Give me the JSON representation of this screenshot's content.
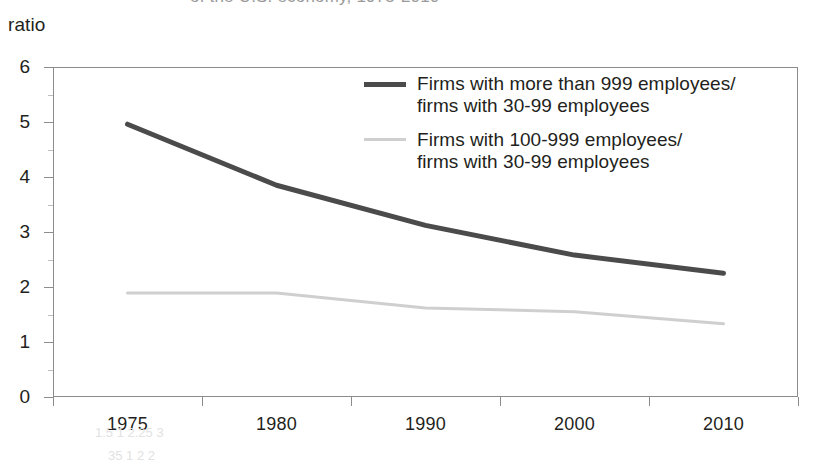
{
  "figure": {
    "unit_label": "ratio",
    "top_cropped_text": "of the U.S. economy, 1975-2010",
    "artifact_text_1": "1.5    1    2.25   3",
    "artifact_text_2": "35   1    2    2"
  },
  "legend": {
    "position": "inside-top-right",
    "entries": [
      {
        "swatch": "dark",
        "color": "#4b4b4b",
        "label": "Firms with more than 999 employees/\nfirms with 30-99 employees"
      },
      {
        "swatch": "light",
        "color": "#cfcfcf",
        "label": "Firms with 100-999 employees/\nfirms with 30-99 employees"
      }
    ]
  },
  "chart_data": {
    "type": "line",
    "title": "",
    "subtitle": "",
    "xlabel": "",
    "ylabel": "ratio",
    "categories": [
      "1975",
      "1980",
      "1990",
      "2000",
      "2010"
    ],
    "xtick_labels": [
      "1975",
      "1980",
      "1990",
      "2000",
      "2010"
    ],
    "ytick_labels": [
      "0",
      "1",
      "2",
      "3",
      "4",
      "5",
      "6"
    ],
    "ytick_values": [
      0,
      1,
      2,
      3,
      4,
      5,
      6
    ],
    "ylim": [
      0,
      6
    ],
    "grid": false,
    "series": [
      {
        "name": "Firms with more than 999 employees/firms with 30-99 employees",
        "color": "#4b4b4b",
        "width": 5,
        "values": [
          4.96,
          3.85,
          3.12,
          2.58,
          2.25
        ]
      },
      {
        "name": "Firms with 100-999 employees/firms with 30-99 employees",
        "color": "#cfcfcf",
        "width": 3,
        "values": [
          1.89,
          1.89,
          1.62,
          1.55,
          1.33
        ]
      }
    ]
  }
}
